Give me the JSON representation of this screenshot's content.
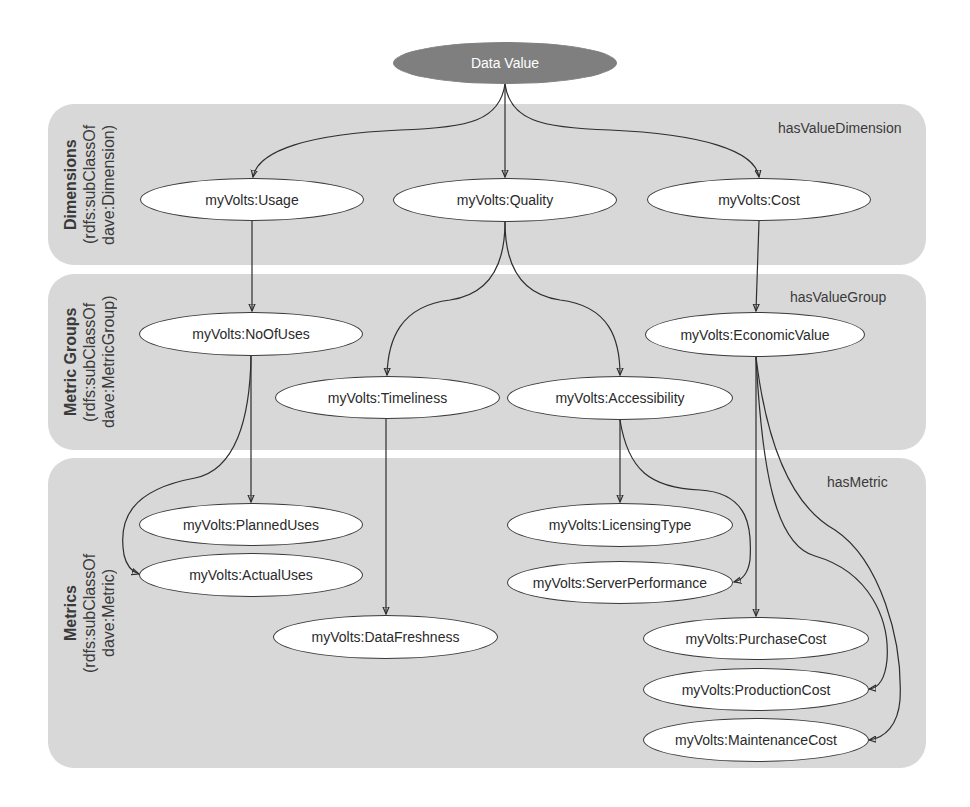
{
  "diagram": {
    "root": {
      "label": "Data Value",
      "color": "#7f7f7f"
    },
    "bands": [
      {
        "title": "Dimensions",
        "subtitle1": "(rdfs:subClassOf",
        "subtitle2": "dave:Dimension)",
        "relation": "hasValueDimension"
      },
      {
        "title": "Metric Groups",
        "subtitle1": "(rdfs:subClassOf",
        "subtitle2": "dave:MetricGroup)",
        "relation": "hasValueGroup"
      },
      {
        "title": "Metrics",
        "subtitle1": "(rdfs:subClassOf",
        "subtitle2": "dave:Metric)",
        "relation": "hasMetric"
      }
    ],
    "nodes": {
      "usage": "myVolts:Usage",
      "quality": "myVolts:Quality",
      "cost": "myVolts:Cost",
      "noofuses": "myVolts:NoOfUses",
      "timeliness": "myVolts:Timeliness",
      "accessibility": "myVolts:Accessibility",
      "economicvalue": "myVolts:EconomicValue",
      "planneduses": "myVolts:PlannedUses",
      "actualuses": "myVolts:ActualUses",
      "datafreshness": "myVolts:DataFreshness",
      "licensingtype": "myVolts:LicensingType",
      "serverperformance": "myVolts:ServerPerformance",
      "purchasecost": "myVolts:PurchaseCost",
      "productioncost": "myVolts:ProductionCost",
      "maintenancecost": "myVolts:MaintenanceCost"
    },
    "edges": [
      [
        "Data Value",
        "myVolts:Usage"
      ],
      [
        "Data Value",
        "myVolts:Quality"
      ],
      [
        "Data Value",
        "myVolts:Cost"
      ],
      [
        "myVolts:Usage",
        "myVolts:NoOfUses"
      ],
      [
        "myVolts:Quality",
        "myVolts:Timeliness"
      ],
      [
        "myVolts:Quality",
        "myVolts:Accessibility"
      ],
      [
        "myVolts:Cost",
        "myVolts:EconomicValue"
      ],
      [
        "myVolts:NoOfUses",
        "myVolts:PlannedUses"
      ],
      [
        "myVolts:NoOfUses",
        "myVolts:ActualUses"
      ],
      [
        "myVolts:Timeliness",
        "myVolts:DataFreshness"
      ],
      [
        "myVolts:Accessibility",
        "myVolts:LicensingType"
      ],
      [
        "myVolts:Accessibility",
        "myVolts:ServerPerformance"
      ],
      [
        "myVolts:EconomicValue",
        "myVolts:PurchaseCost"
      ],
      [
        "myVolts:EconomicValue",
        "myVolts:ProductionCost"
      ],
      [
        "myVolts:EconomicValue",
        "myVolts:MaintenanceCost"
      ]
    ]
  }
}
